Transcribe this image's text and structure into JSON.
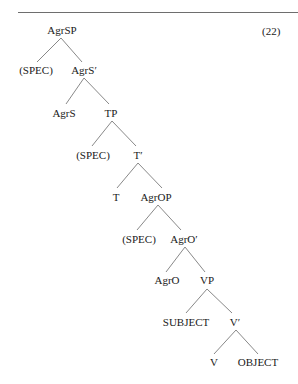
{
  "figure": {
    "example_number": "(22)",
    "rule_color": "#6e6e6e",
    "branch_color": "#7a7a7a"
  },
  "tree": {
    "nodes": [
      {
        "id": "agrsp",
        "label": "AgrSP",
        "x": 62,
        "y": 30
      },
      {
        "id": "spec1",
        "label": "(SPEC)",
        "x": 36,
        "y": 70
      },
      {
        "id": "agrs_bar",
        "label": "AgrS′",
        "x": 84,
        "y": 70
      },
      {
        "id": "agrs",
        "label": "AgrS",
        "x": 64,
        "y": 113
      },
      {
        "id": "tp",
        "label": "TP",
        "x": 111,
        "y": 113
      },
      {
        "id": "spec2",
        "label": "(SPEC)",
        "x": 93,
        "y": 155
      },
      {
        "id": "t_bar",
        "label": "T′",
        "x": 138,
        "y": 155
      },
      {
        "id": "t",
        "label": "T",
        "x": 116,
        "y": 197
      },
      {
        "id": "agrop",
        "label": "AgrOP",
        "x": 156,
        "y": 197
      },
      {
        "id": "spec3",
        "label": "(SPEC)",
        "x": 139,
        "y": 239
      },
      {
        "id": "agro_bar",
        "label": "AgrO′",
        "x": 184,
        "y": 239
      },
      {
        "id": "agro",
        "label": "AgrO",
        "x": 167,
        "y": 280
      },
      {
        "id": "vp",
        "label": "VP",
        "x": 207,
        "y": 280
      },
      {
        "id": "subject",
        "label": "SUBJECT",
        "x": 186,
        "y": 322
      },
      {
        "id": "v_bar",
        "label": "V′",
        "x": 235,
        "y": 322
      },
      {
        "id": "v",
        "label": "V",
        "x": 214,
        "y": 362
      },
      {
        "id": "object",
        "label": "OBJECT",
        "x": 258,
        "y": 362
      }
    ],
    "edges": [
      {
        "from": "agrsp",
        "to": "spec1",
        "x1": 61,
        "y1": 38,
        "x2": 37,
        "y2": 62
      },
      {
        "from": "agrsp",
        "to": "agrs_bar",
        "x1": 61,
        "y1": 38,
        "x2": 82,
        "y2": 62
      },
      {
        "from": "agrs_bar",
        "to": "agrs",
        "x1": 84,
        "y1": 78,
        "x2": 66,
        "y2": 104
      },
      {
        "from": "agrs_bar",
        "to": "tp",
        "x1": 84,
        "y1": 78,
        "x2": 109,
        "y2": 104
      },
      {
        "from": "tp",
        "to": "spec2",
        "x1": 112,
        "y1": 121,
        "x2": 92,
        "y2": 146
      },
      {
        "from": "tp",
        "to": "t_bar",
        "x1": 112,
        "y1": 121,
        "x2": 136,
        "y2": 146
      },
      {
        "from": "t_bar",
        "to": "t",
        "x1": 138,
        "y1": 163,
        "x2": 117,
        "y2": 188
      },
      {
        "from": "t_bar",
        "to": "agrop",
        "x1": 138,
        "y1": 163,
        "x2": 162,
        "y2": 188
      },
      {
        "from": "agrop",
        "to": "spec3",
        "x1": 158,
        "y1": 205,
        "x2": 137,
        "y2": 230
      },
      {
        "from": "agrop",
        "to": "agro_bar",
        "x1": 158,
        "y1": 205,
        "x2": 181,
        "y2": 230
      },
      {
        "from": "agro_bar",
        "to": "agro",
        "x1": 185,
        "y1": 247,
        "x2": 166,
        "y2": 272
      },
      {
        "from": "agro_bar",
        "to": "vp",
        "x1": 185,
        "y1": 247,
        "x2": 205,
        "y2": 272
      },
      {
        "from": "vp",
        "to": "subject",
        "x1": 207,
        "y1": 289,
        "x2": 186,
        "y2": 313
      },
      {
        "from": "vp",
        "to": "v_bar",
        "x1": 207,
        "y1": 289,
        "x2": 232,
        "y2": 313
      },
      {
        "from": "v_bar",
        "to": "v",
        "x1": 236,
        "y1": 330,
        "x2": 214,
        "y2": 354
      },
      {
        "from": "v_bar",
        "to": "object",
        "x1": 236,
        "y1": 330,
        "x2": 258,
        "y2": 354
      }
    ]
  }
}
